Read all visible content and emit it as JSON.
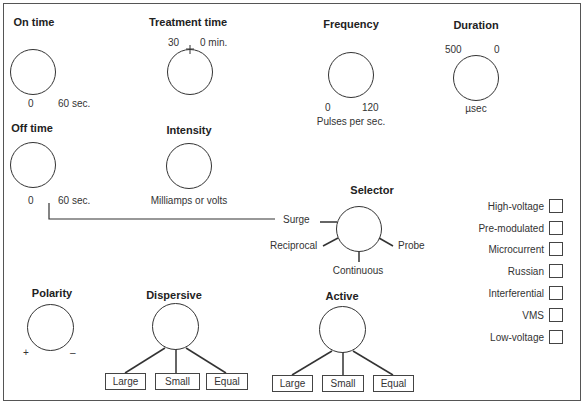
{
  "controls": {
    "on_time": {
      "title": "On time",
      "min": "0",
      "max": "60 sec."
    },
    "treatment_time": {
      "title": "Treatment time",
      "left": "30",
      "right": "0 min."
    },
    "frequency": {
      "title": "Frequency",
      "min": "0",
      "max": "120",
      "unit": "Pulses per sec."
    },
    "duration": {
      "title": "Duration",
      "left": "500",
      "right": "0",
      "unit": "µsec"
    },
    "off_time": {
      "title": "Off time",
      "min": "0",
      "max": "60 sec."
    },
    "intensity": {
      "title": "Intensity",
      "unit": "Milliamps or volts"
    },
    "selector": {
      "title": "Selector",
      "positions": [
        "Surge",
        "Reciprocal",
        "Continuous",
        "Probe"
      ]
    },
    "polarity": {
      "title": "Polarity",
      "plus": "+",
      "minus": "–"
    },
    "dispersive": {
      "title": "Dispersive",
      "options": [
        "Large",
        "Small",
        "Equal"
      ]
    },
    "active": {
      "title": "Active",
      "options": [
        "Large",
        "Small",
        "Equal"
      ]
    }
  },
  "current_types": {
    "items": [
      "High-voltage",
      "Pre-modulated",
      "Microcurrent",
      "Russian",
      "Interferential",
      "VMS",
      "Low-voltage"
    ]
  },
  "colors": {
    "line": "#333333",
    "frame": "#555555",
    "background": "#ffffff"
  }
}
